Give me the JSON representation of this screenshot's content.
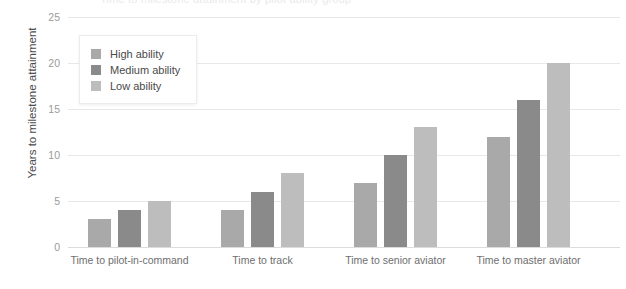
{
  "chart_data": {
    "type": "bar",
    "title": "Time to milestone attainment by pilot ability group",
    "xlabel": "",
    "ylabel": "Years to milestone attainment",
    "ylim": [
      0,
      25
    ],
    "yticks": [
      0,
      5,
      10,
      15,
      20,
      25
    ],
    "grid": true,
    "legend_position": "upper-left",
    "categories": [
      "Time to pilot-in-command",
      "Time to track",
      "Time to senior aviator",
      "Time to master aviator"
    ],
    "series": [
      {
        "name": "High ability",
        "color": "#a9a9a9",
        "values": [
          3,
          4,
          7,
          12
        ]
      },
      {
        "name": "Medium ability",
        "color": "#8a8a8a",
        "values": [
          4,
          6,
          10,
          16
        ]
      },
      {
        "name": "Low ability",
        "color": "#bdbdbd",
        "values": [
          5,
          8,
          13,
          20
        ]
      }
    ]
  },
  "axis": {
    "y_title": "Years to milestone attainment",
    "ticks": [
      "0",
      "5",
      "10",
      "15",
      "20",
      "25"
    ]
  },
  "legend": {
    "items": [
      {
        "label": "High ability"
      },
      {
        "label": "Medium ability"
      },
      {
        "label": "Low ability"
      }
    ]
  },
  "colors": {
    "high": "#a9a9a9",
    "medium": "#8a8a8a",
    "low": "#bdbdbd",
    "gridline": "#e8e8ea",
    "tick_text": "#9b9b9b",
    "category_text": "#6e6e6e",
    "axis_title_text": "#4c4c4c",
    "background": "#ffffff"
  }
}
